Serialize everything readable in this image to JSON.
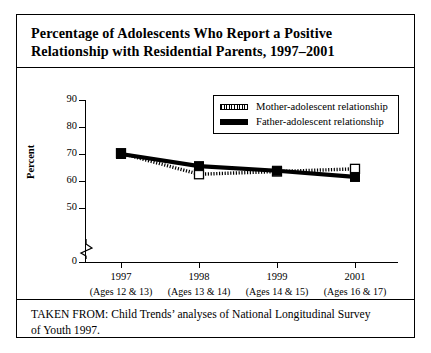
{
  "figure": {
    "title_line_1": "Percentage of Adolescents Who Report a Positive",
    "title_line_2": "Relationship with Residential Parents, 1997–2001",
    "source_line_1": "TAKEN FROM: Child Trends’ analyses of National Longitudinal Survey",
    "source_line_2": "of Youth 1997."
  },
  "chart_data": {
    "type": "line",
    "title": "Percentage of Adolescents Who Report a Positive Relationship with Residential Parents, 1997–2001",
    "xlabel": "",
    "ylabel": "Percent",
    "categories": [
      "1997",
      "1998",
      "1999",
      "2001"
    ],
    "category_sublabels": [
      "(Ages 12 & 13)",
      "(Ages 13 & 14)",
      "(Ages 14 & 15)",
      "(Ages 16 & 17)"
    ],
    "ylim": [
      0,
      90
    ],
    "yticks": [
      0,
      50,
      60,
      70,
      80,
      90
    ],
    "ytick_labels": [
      "0",
      "50",
      "60",
      "70",
      "80",
      "90"
    ],
    "y_axis_break": true,
    "y_axis_break_between": [
      0,
      50
    ],
    "grid": false,
    "legend_position": "top-right",
    "series": [
      {
        "name": "Mother-adolescent relationship",
        "values": [
          70.3,
          62.5,
          63.5,
          64.5
        ],
        "marker": "open-square",
        "line_style": "hatched-thin",
        "color": "#000000"
      },
      {
        "name": "Father-adolescent relationship",
        "values": [
          70.0,
          65.5,
          63.8,
          61.5
        ],
        "marker": "filled-square",
        "line_style": "thick-solid",
        "color": "#000000"
      }
    ]
  },
  "colors": {
    "ink": "#000000",
    "paper": "#ffffff"
  }
}
